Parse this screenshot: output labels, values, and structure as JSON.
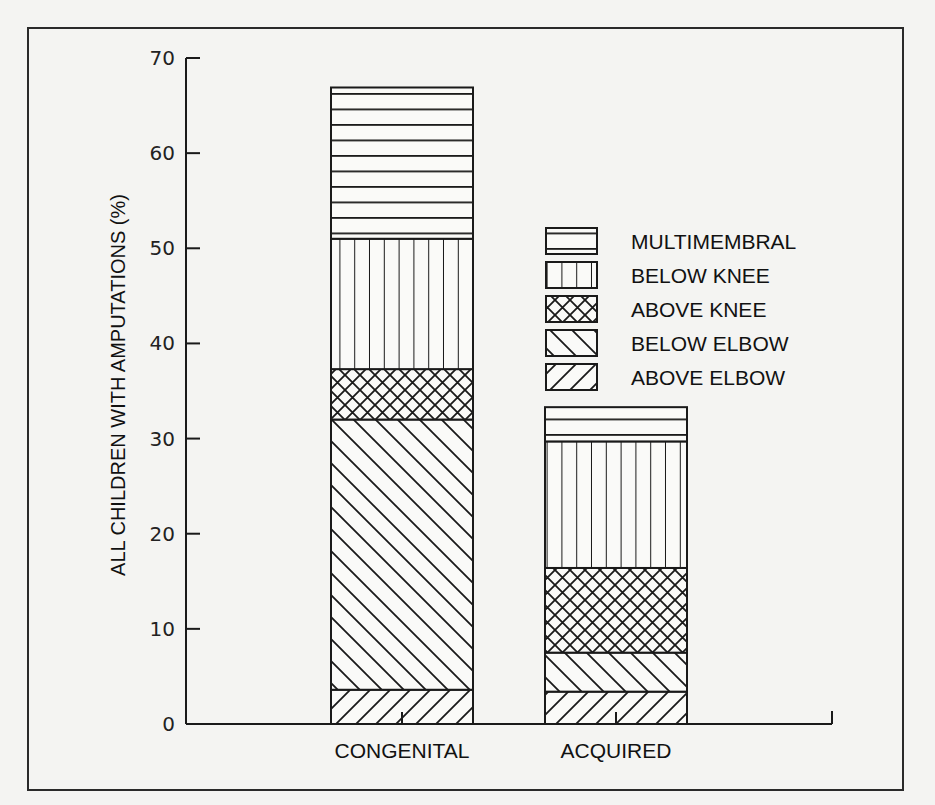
{
  "chart_data": {
    "type": "bar",
    "stacked": true,
    "title": "",
    "xlabel": "",
    "ylabel": "ALL CHILDREN WITH AMPUTATIONS (%)",
    "ylim": [
      0,
      70
    ],
    "yticks": [
      0,
      10,
      20,
      30,
      40,
      50,
      60,
      70
    ],
    "grid": false,
    "legend_position": "upper right (inside plot)",
    "categories": [
      "CONGENITAL",
      "ACQUIRED"
    ],
    "series": [
      {
        "name": "ABOVE ELBOW",
        "pattern": "diagonal-up",
        "values": [
          3.6,
          3.4
        ]
      },
      {
        "name": "BELOW ELBOW",
        "pattern": "diagonal-down",
        "values": [
          28.4,
          4.1
        ]
      },
      {
        "name": "ABOVE KNEE",
        "pattern": "crosshatch",
        "values": [
          5.3,
          8.9
        ]
      },
      {
        "name": "BELOW KNEE",
        "pattern": "vertical",
        "values": [
          13.7,
          13.3
        ]
      },
      {
        "name": "MULTIMEMBRAL",
        "pattern": "horizontal",
        "values": [
          15.9,
          3.6
        ]
      }
    ],
    "totals": [
      66.9,
      33.3
    ],
    "legend_order": [
      "MULTIMEMBRAL",
      "BELOW KNEE",
      "ABOVE KNEE",
      "BELOW ELBOW",
      "ABOVE ELBOW"
    ]
  },
  "colors": {
    "ink": "#1a1a1a",
    "paper": "#f4f4f2"
  }
}
